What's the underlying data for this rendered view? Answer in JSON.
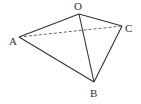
{
  "figure": {
    "type": "tetrahedron",
    "vertices": {
      "O": {
        "label": "O",
        "x": 79,
        "y": 14,
        "lx": 74,
        "ly": 10
      },
      "A": {
        "label": "A",
        "x": 19,
        "y": 37,
        "lx": 9,
        "ly": 45
      },
      "B": {
        "label": "B",
        "x": 94,
        "y": 82,
        "lx": 90,
        "ly": 97
      },
      "C": {
        "label": "C",
        "x": 122,
        "y": 26,
        "lx": 125,
        "ly": 32
      }
    },
    "solid_edges": [
      [
        "O",
        "A"
      ],
      [
        "O",
        "B"
      ],
      [
        "O",
        "C"
      ],
      [
        "A",
        "B"
      ],
      [
        "B",
        "C"
      ]
    ],
    "dashed_edges": [
      [
        "A",
        "C"
      ]
    ],
    "stroke_color": "#333333"
  }
}
